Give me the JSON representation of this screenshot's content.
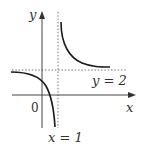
{
  "diagram": {
    "axis_labels": {
      "x": "x",
      "y": "y",
      "origin": "0"
    },
    "asymptotes": {
      "vertical_label": "x = 1",
      "horizontal_label": "y = 2"
    },
    "colors": {
      "curve": "#1a1a1a",
      "axis": "#444444",
      "asymptote": "#666666",
      "background": "#ffffff"
    }
  }
}
